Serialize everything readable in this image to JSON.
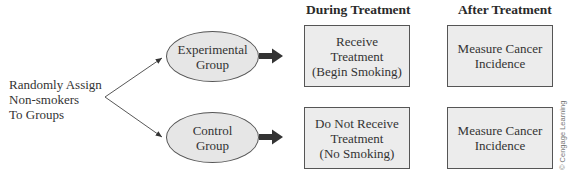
{
  "headers": {
    "during": "During Treatment",
    "after": "After Treatment"
  },
  "assignment": {
    "line1": "Randomly Assign",
    "line2": "Non-smokers",
    "line3": "To Groups"
  },
  "groups": [
    {
      "line1": "Experimental",
      "line2": "Group"
    },
    {
      "line1": "Control",
      "line2": "Group"
    }
  ],
  "during_boxes": [
    {
      "line1": "Receive",
      "line2": "Treatment",
      "line3": "(Begin Smoking)"
    },
    {
      "line1": "Do Not Receive",
      "line2": "Treatment",
      "line3": "(No Smoking)"
    }
  ],
  "after_boxes": [
    {
      "line1": "Measure Cancer",
      "line2": "Incidence"
    },
    {
      "line1": "Measure Cancer",
      "line2": "Incidence"
    }
  ],
  "copyright": "© Cengage Learning",
  "colors": {
    "box_fill": "#ececec",
    "ellipse_fill": "#e6e6e6",
    "stroke": "#555555",
    "arrow": "#333333"
  }
}
